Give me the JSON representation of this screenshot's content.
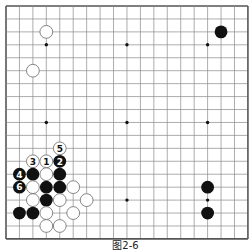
{
  "board": {
    "size": 19,
    "origin_x": 6,
    "origin_y": 6,
    "spacing_x": 13.44,
    "spacing_y": 12.94,
    "stone_radius": 6.4,
    "colors": {
      "grid": "#8a8a8a",
      "edge": "#555555",
      "black": "#111111",
      "white_fill": "#ffffff",
      "white_stroke": "#777777",
      "star": "#111111"
    },
    "star_points": [
      [
        3,
        3
      ],
      [
        9,
        3
      ],
      [
        15,
        3
      ],
      [
        3,
        9
      ],
      [
        9,
        9
      ],
      [
        15,
        9
      ],
      [
        3,
        15
      ],
      [
        9,
        15
      ],
      [
        15,
        15
      ]
    ],
    "stones": [
      {
        "col": 3,
        "row": 2,
        "color": "white",
        "label": ""
      },
      {
        "col": 2,
        "row": 5,
        "color": "white",
        "label": ""
      },
      {
        "col": 16,
        "row": 2,
        "color": "black",
        "label": ""
      },
      {
        "col": 15,
        "row": 14,
        "color": "black",
        "label": ""
      },
      {
        "col": 15,
        "row": 16,
        "color": "black",
        "label": ""
      },
      {
        "col": 4,
        "row": 11,
        "color": "white",
        "label": "5"
      },
      {
        "col": 2,
        "row": 12,
        "color": "white",
        "label": "3"
      },
      {
        "col": 3,
        "row": 12,
        "color": "white",
        "label": "1"
      },
      {
        "col": 4,
        "row": 12,
        "color": "black",
        "label": "2"
      },
      {
        "col": 1,
        "row": 13,
        "color": "black",
        "label": "4"
      },
      {
        "col": 2,
        "row": 13,
        "color": "black",
        "label": ""
      },
      {
        "col": 3,
        "row": 13,
        "color": "white",
        "label": ""
      },
      {
        "col": 4,
        "row": 13,
        "color": "black",
        "label": ""
      },
      {
        "col": 1,
        "row": 14,
        "color": "black",
        "label": "6"
      },
      {
        "col": 2,
        "row": 14,
        "color": "white",
        "label": ""
      },
      {
        "col": 3,
        "row": 14,
        "color": "black",
        "label": ""
      },
      {
        "col": 4,
        "row": 14,
        "color": "black",
        "label": ""
      },
      {
        "col": 5,
        "row": 14,
        "color": "white",
        "label": ""
      },
      {
        "col": 2,
        "row": 15,
        "color": "white",
        "label": ""
      },
      {
        "col": 3,
        "row": 15,
        "color": "black",
        "label": ""
      },
      {
        "col": 4,
        "row": 15,
        "color": "white",
        "label": ""
      },
      {
        "col": 6,
        "row": 15,
        "color": "white",
        "label": ""
      },
      {
        "col": 1,
        "row": 16,
        "color": "black",
        "label": ""
      },
      {
        "col": 2,
        "row": 16,
        "color": "black",
        "label": ""
      },
      {
        "col": 3,
        "row": 16,
        "color": "white",
        "label": ""
      },
      {
        "col": 5,
        "row": 16,
        "color": "white",
        "label": ""
      },
      {
        "col": 3,
        "row": 17,
        "color": "white",
        "label": ""
      },
      {
        "col": 4,
        "row": 17,
        "color": "white",
        "label": ""
      }
    ]
  },
  "caption": "图2-6"
}
